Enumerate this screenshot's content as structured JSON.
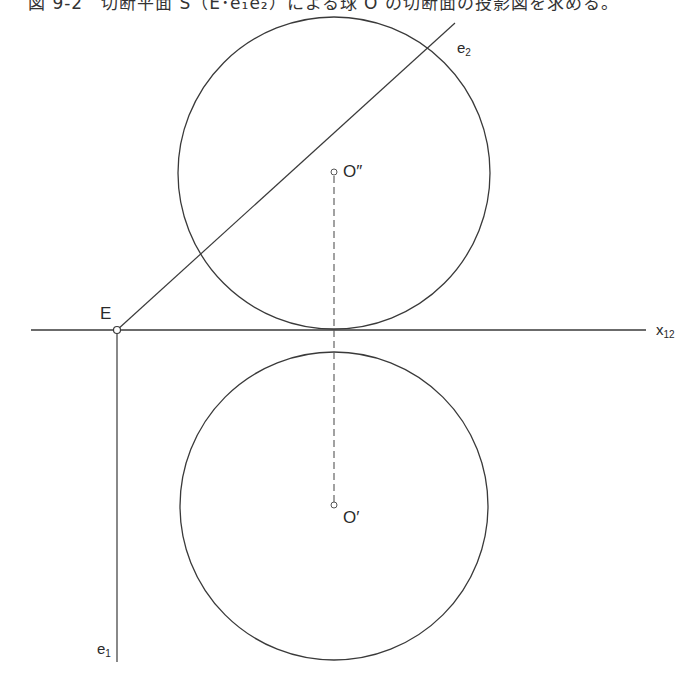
{
  "caption": "図 9-2　切断平面 S（E･e₁e₂）による球 O の切断面の投影図を求める。",
  "figure": {
    "stroke_color": "#3a3a3a",
    "axis": {
      "label_base": "x",
      "label_sub": "12",
      "x1": 31,
      "x2": 646,
      "y": 330
    },
    "point_E": {
      "label": "E",
      "x": 117,
      "y": 330
    },
    "trace_e1": {
      "label_base": "e",
      "label_sub": "1",
      "x": 117,
      "y1": 330,
      "y2": 662
    },
    "trace_e2": {
      "label_base": "e",
      "label_sub": "2",
      "x1": 117,
      "y1": 330,
      "x2": 455,
      "y2": 23
    },
    "sphere_front_view": {
      "center_label": "O″",
      "cx": 334,
      "cy": 173,
      "r": 156
    },
    "sphere_top_view": {
      "center_label": "O′",
      "cx": 334,
      "cy": 506,
      "r": 154
    },
    "projector_line": {
      "style": "dashed",
      "x": 334,
      "y1": 173,
      "y2": 506
    }
  }
}
